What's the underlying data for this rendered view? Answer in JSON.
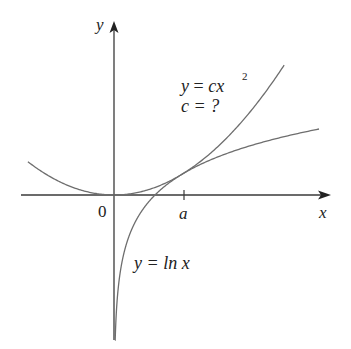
{
  "figure": {
    "axes": {
      "x_label": "x",
      "y_label": "y",
      "origin_label": "0",
      "tick_label": "a"
    },
    "curves": [
      {
        "name": "parabola",
        "equation_lhs": "y",
        "equation_eq": "=",
        "equation_rhs": "cx",
        "exponent": "2",
        "question": "c = ?"
      },
      {
        "name": "log",
        "equation": "y = ln x"
      }
    ],
    "colors": {
      "axis": "#3a3a3a",
      "curve": "#6e6e6e",
      "text": "#222222",
      "background": "#ffffff"
    }
  },
  "chart_data": {
    "type": "line",
    "title": "",
    "xlabel": "x",
    "ylabel": "y",
    "series": [
      {
        "name": "y = cx^2",
        "c": 0.184,
        "x_range": [
          -2.1,
          4.15
        ]
      },
      {
        "name": "y = ln x",
        "x_range": [
          0.0005,
          5.0
        ]
      }
    ],
    "annotations": [
      "y = cx^2",
      "c = ?",
      "y = ln x",
      "0",
      "a"
    ],
    "tangent_point": {
      "label": "a",
      "x": 1.6487
    },
    "grid": false
  }
}
